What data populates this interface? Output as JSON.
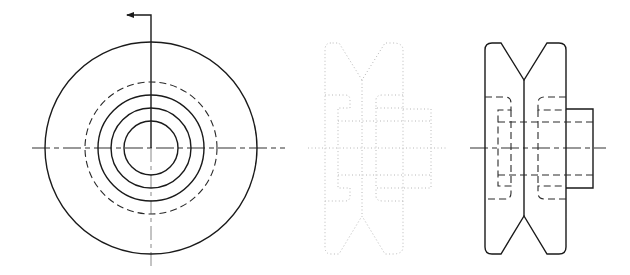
{
  "drawing": {
    "title": "V-groove pulley — orthographic views",
    "colors": {
      "line": "#1a1a1a",
      "hidden_line": "#2a2a2a",
      "ghost_line": "#b8b8b8",
      "background": "#ffffff"
    },
    "views": [
      {
        "name": "front-view",
        "center": [
          151,
          148
        ],
        "outer_circle_r": 106,
        "hidden_circle_r": 66,
        "solid_circles_r": [
          53,
          40,
          27
        ],
        "section_arrow": {
          "from": [
            151,
            15
          ],
          "to": [
            127,
            15
          ],
          "direction": "left"
        }
      },
      {
        "name": "ghost-side-view",
        "style": "dotted",
        "x_range": [
          325,
          431
        ]
      },
      {
        "name": "side-view",
        "flange_x": [
          485,
          566
        ],
        "groove_apex_x": 524,
        "height_y": [
          43,
          254
        ],
        "hub": {
          "x": [
            566,
            593
          ],
          "y": [
            109,
            188
          ]
        },
        "centerline_y": 148
      }
    ]
  }
}
